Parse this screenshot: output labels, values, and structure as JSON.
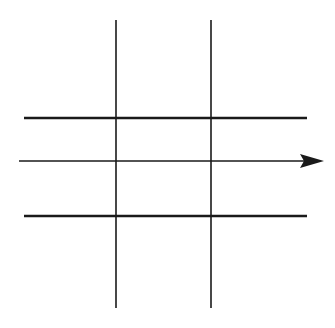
{
  "diagram": {
    "title": "",
    "background": "#ffffff",
    "stroke_color": "#1a1a1a",
    "vertical_lines": [
      {
        "id": "v1",
        "x": 116,
        "y1": 20,
        "y2": 308,
        "width": 1.6
      },
      {
        "id": "v2",
        "x": 211,
        "y1": 20,
        "y2": 308,
        "width": 1.6
      }
    ],
    "horizontal_lines": [
      {
        "id": "h1",
        "y": 118,
        "x1": 24,
        "x2": 307,
        "width": 2.6
      },
      {
        "id": "h2",
        "y": 216,
        "x1": 24,
        "x2": 307,
        "width": 2.6
      }
    ],
    "arrow": {
      "id": "arrow",
      "y": 161,
      "x1": 19,
      "x2": 302,
      "tip_x": 324,
      "head_half_height": 7,
      "width": 1.4,
      "direction": "right"
    }
  }
}
